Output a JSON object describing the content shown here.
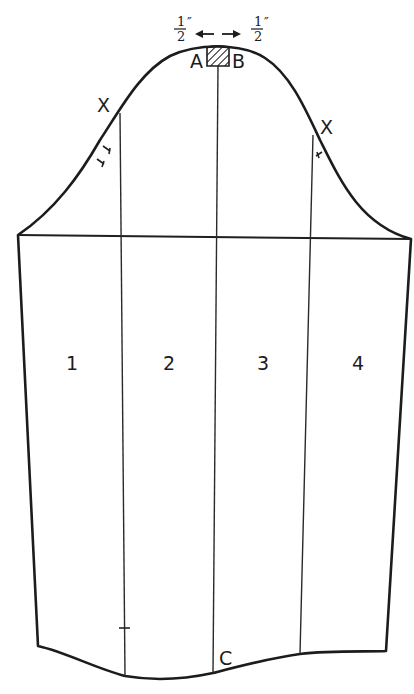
{
  "diagram": {
    "section_labels": [
      "1",
      "2",
      "3",
      "4"
    ],
    "point_labels": {
      "a": "A",
      "b": "B",
      "c": "C",
      "x_left": "X",
      "x_right": "X"
    },
    "measurements": {
      "left_num": "1",
      "left_den": "2",
      "left_unit": "″",
      "right_num": "1",
      "right_den": "2",
      "right_unit": "″"
    },
    "annotations": {
      "spread_arrows": "arrows indicating 1/2 inch spread on each side of A–B",
      "hatched_area": "hatched insert between A and B at sleeve cap",
      "front_notch": "single notch",
      "back_notch": "double notch"
    },
    "colors": {
      "line": "#1c1c1c",
      "background": "#ffffff"
    }
  }
}
